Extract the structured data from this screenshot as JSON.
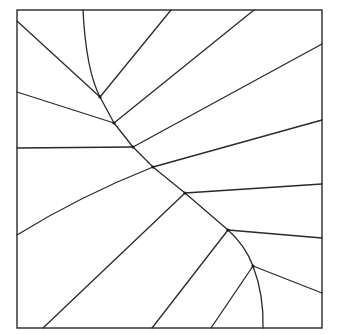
{
  "diagram": {
    "type": "planar-subdivision",
    "colors": {
      "stroke": "#2a2a2a",
      "background": "#ffffff"
    },
    "frame": {
      "x": 17,
      "y": 10,
      "width": 305,
      "height": 318
    },
    "vertices": [
      {
        "id": "V1",
        "x": 100,
        "y": 97
      },
      {
        "id": "V2",
        "x": 114,
        "y": 123
      },
      {
        "id": "V3",
        "x": 133,
        "y": 147
      },
      {
        "id": "V4",
        "x": 153,
        "y": 167
      },
      {
        "id": "V5",
        "x": 185,
        "y": 193
      },
      {
        "id": "V6",
        "x": 228,
        "y": 230
      },
      {
        "id": "V7",
        "x": 253,
        "y": 266
      }
    ],
    "edges": [
      {
        "id": "curve-top",
        "d": "M83,10 Q86,70 100,97"
      },
      {
        "id": "e-left-v1",
        "d": "M17,21 L100,97"
      },
      {
        "id": "e-v1-top",
        "d": "M100,97 L171,10"
      },
      {
        "id": "e-v1-v2",
        "d": "M100,97 L114,123"
      },
      {
        "id": "e-left-v2",
        "d": "M17,92 L114,123"
      },
      {
        "id": "e-v2-top",
        "d": "M114,123 L254,10"
      },
      {
        "id": "e-v2-v3",
        "d": "M114,123 L133,147"
      },
      {
        "id": "e-left-v3",
        "d": "M17,148 L133,147"
      },
      {
        "id": "e-v3-right",
        "d": "M133,147 L322,44"
      },
      {
        "id": "e-v3-v4",
        "d": "M133,147 L153,167"
      },
      {
        "id": "e-v4-right",
        "d": "M153,167 L322,120"
      },
      {
        "id": "e-v4-left",
        "d": "M153,167 Q80,196 17,235"
      },
      {
        "id": "e-v4-v5",
        "d": "M153,167 L185,193"
      },
      {
        "id": "e-v5-right",
        "d": "M185,193 L322,184"
      },
      {
        "id": "e-v5-bottom",
        "d": "M185,193 L43,328"
      },
      {
        "id": "e-v5-v6",
        "d": "M185,193 L228,230"
      },
      {
        "id": "e-v6-right",
        "d": "M228,230 L322,238"
      },
      {
        "id": "e-v6-bottom",
        "d": "M228,230 L152,328"
      },
      {
        "id": "e-v6-v7",
        "d": "M228,230 Q245,245 253,266"
      },
      {
        "id": "e-v7-right",
        "d": "M253,266 L322,293"
      },
      {
        "id": "e-v7-bottom",
        "d": "M253,266 L211,328"
      },
      {
        "id": "curve-bottom",
        "d": "M253,266 Q264,295 263,328"
      }
    ]
  }
}
